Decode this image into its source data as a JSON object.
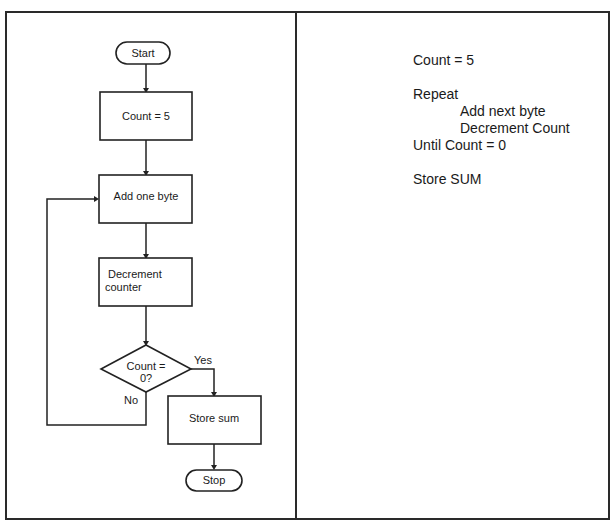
{
  "flowchart": {
    "start": "Start",
    "init": "Count = 5",
    "add": "Add one byte",
    "decrement_line1": "Decrement",
    "decrement_line2": "counter",
    "decision_line1": "Count =",
    "decision_line2": "0?",
    "yes_label": "Yes",
    "no_label": "No",
    "store": "Store sum",
    "stop": "Stop"
  },
  "pseudocode": {
    "lines": [
      {
        "text": "Count = 5",
        "indent": 0
      },
      {
        "text": "Repeat",
        "indent": 0
      },
      {
        "text": "Add next byte",
        "indent": 1
      },
      {
        "text": "Decrement Count",
        "indent": 1
      },
      {
        "text": "Until Count = 0",
        "indent": 0
      },
      {
        "text": "Store SUM",
        "indent": 0
      }
    ]
  },
  "colors": {
    "stroke": "#222222",
    "background": "#ffffff",
    "text": "#1a1a1a"
  }
}
